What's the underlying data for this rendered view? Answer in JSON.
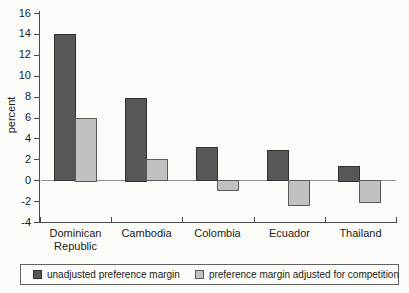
{
  "figure": {
    "background": "#fbfbf8"
  },
  "chart_data": {
    "type": "bar",
    "title": "",
    "xlabel": "",
    "ylabel": "percent",
    "ylim": [
      -4,
      16
    ],
    "ytick_step": 2,
    "yticks": [
      16,
      14,
      12,
      10,
      8,
      6,
      4,
      2,
      0,
      -2,
      -4
    ],
    "grid": false,
    "legend_position": "bottom",
    "categories": [
      "Dominican Republic",
      "Cambodia",
      "Colombia",
      "Ecuador",
      "Thailand"
    ],
    "series": [
      {
        "name": "unadjusted preference margin",
        "color": "#575757",
        "border_color": "#303030",
        "values": [
          14.0,
          7.9,
          3.2,
          2.9,
          1.4
        ]
      },
      {
        "name": "preference margin adjusted for competition",
        "color": "#c1c1c1",
        "border_color": "#5a5a5a",
        "values": [
          6.0,
          2.0,
          -1.0,
          -2.4,
          -2.1
        ]
      }
    ],
    "colors": {
      "axis": "#4a4a4a",
      "zero_line": "#919191",
      "text": "#1c1c1c"
    }
  }
}
